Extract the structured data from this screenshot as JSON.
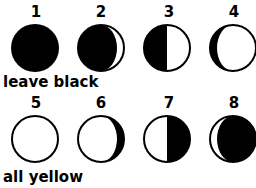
{
  "phases": [
    {
      "number": "1",
      "name": "new-moon"
    },
    {
      "number": "2",
      "name": "waxing-crescent-shadow"
    },
    {
      "number": "3",
      "name": "first-quarter-shadow"
    },
    {
      "number": "4",
      "name": "waxing-gibbous-shadow"
    },
    {
      "number": "5",
      "name": "full-moon"
    },
    {
      "number": "6",
      "name": "waning-gibbous-shadow"
    },
    {
      "number": "7",
      "name": "last-quarter-shadow"
    },
    {
      "number": "8",
      "name": "waning-crescent-shadow"
    }
  ],
  "captions": {
    "row1": "leave black",
    "row2": "all yellow"
  },
  "colors": {
    "ink": "#000000",
    "paper": "#ffffff"
  }
}
